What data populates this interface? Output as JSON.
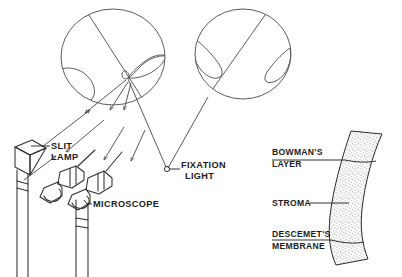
{
  "figure": {
    "background_color": "#ffffff",
    "ink_color": "#1b1b1b",
    "stipple_color": "#8d8d8d"
  },
  "labels": {
    "slit_lamp": {
      "line1": "SLIT",
      "line2": "LAMP"
    },
    "microscope": {
      "text": "MICROSCOPE"
    },
    "fixation_light": {
      "line1": "FIXATION",
      "line2": "LIGHT"
    },
    "bowmans_layer": {
      "line1": "BOWMAN'S",
      "line2": "LAYER"
    },
    "stroma": {
      "text": "STROMA"
    },
    "descemets_membrane": {
      "line1": "DESCEMET'S",
      "line2": "MEMBRANE"
    }
  },
  "icons": {
    "fixation_light_marker": "small-circle-icon",
    "left_eye": "eye-globe-icon",
    "right_eye": "eye-globe-icon",
    "slit_lamp_device": "slit-lamp-icon",
    "microscope_device": "binocular-microscope-icon",
    "cornea_band": "cornea-cross-section-icon"
  },
  "panels": {
    "left_panel_name": "slit-lamp-examination-diagram",
    "right_panel_name": "corneal-layers-diagram"
  }
}
